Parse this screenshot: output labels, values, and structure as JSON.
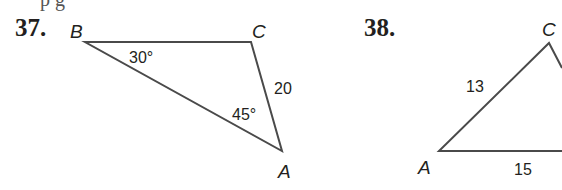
{
  "page_fragment": "p g",
  "problems": [
    {
      "number": "37.",
      "vertices": {
        "B": "B",
        "C": "C",
        "A": "A"
      },
      "angles": {
        "B": "30°",
        "A": "45°"
      },
      "sides": {
        "CA": "20"
      }
    },
    {
      "number": "38.",
      "vertices": {
        "C": "C",
        "A": "A"
      },
      "sides": {
        "AC": "13",
        "AB": "15"
      }
    }
  ]
}
